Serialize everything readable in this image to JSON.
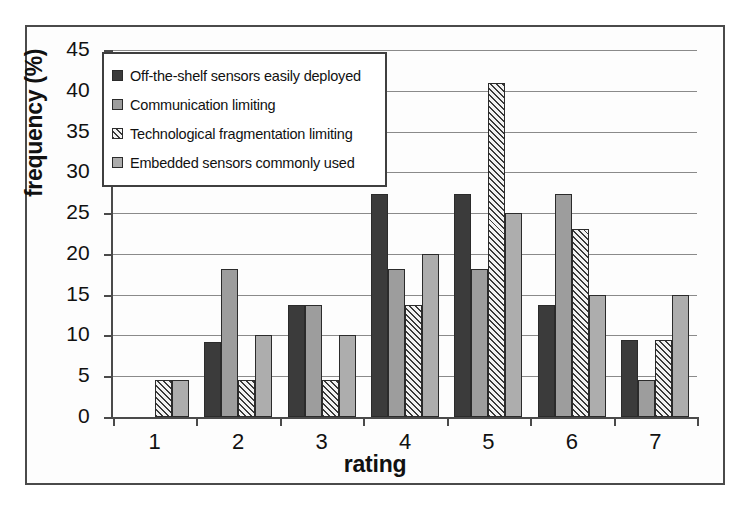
{
  "chart_data": {
    "type": "bar",
    "title": "",
    "xlabel": "rating",
    "ylabel": "frequency (%)",
    "categories": [
      "1",
      "2",
      "3",
      "4",
      "5",
      "6",
      "7"
    ],
    "ylim": [
      0,
      45
    ],
    "yticks": [
      0,
      5,
      10,
      15,
      20,
      25,
      30,
      35,
      40,
      45
    ],
    "grid": true,
    "legend_position": "upper-left-inside",
    "series": [
      {
        "name": "Off-the-shelf sensors easily deployed",
        "swatch": "dark",
        "color": "#3b3b3b",
        "values": [
          0,
          9.2,
          13.7,
          27.4,
          27.4,
          13.7,
          9.4
        ]
      },
      {
        "name": "Communication limiting",
        "swatch": "medium-gray",
        "color": "#9d9d9d",
        "values": [
          0,
          18.2,
          13.7,
          18.2,
          18.2,
          27.4,
          4.6
        ]
      },
      {
        "name": "Technological fragmentation limiting",
        "swatch": "hatched",
        "color": "#f2f2f2",
        "values": [
          4.6,
          4.6,
          4.6,
          13.7,
          41.0,
          23.0,
          9.4
        ]
      },
      {
        "name": "Embedded sensors commonly used",
        "swatch": "light-gray",
        "color": "#adadad",
        "values": [
          4.6,
          10.0,
          10.0,
          20.0,
          25.0,
          15.0,
          15.0
        ]
      }
    ]
  }
}
